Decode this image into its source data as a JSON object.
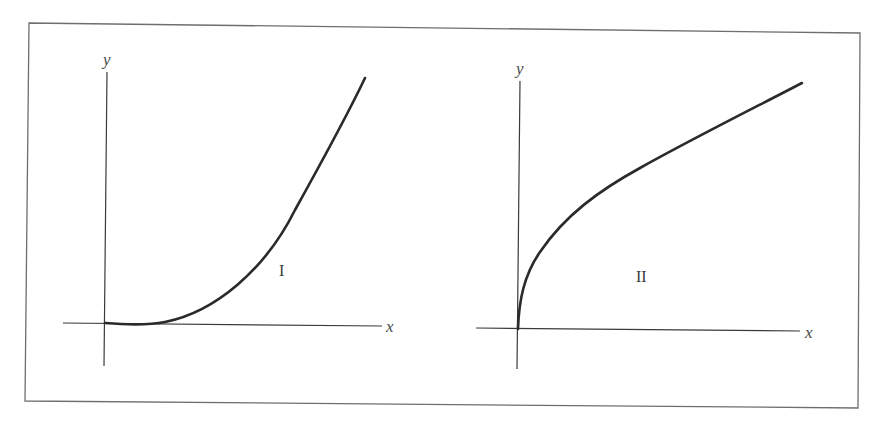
{
  "figure": {
    "graphs": [
      {
        "id": "I",
        "label": "I",
        "x_axis_label": "x",
        "y_axis_label": "y",
        "curve_shape": "concave-up, starts flat at origin and increases (like y = x^2 or x^3)"
      },
      {
        "id": "II",
        "label": "II",
        "x_axis_label": "x",
        "y_axis_label": "y",
        "curve_shape": "concave-down, vertical tangent at origin and increases (like y = sqrt(x))"
      }
    ],
    "colors": {
      "background": "#ffffff",
      "frame": "#6e6e6e",
      "axis": "#3a3a3a",
      "curve": "#2a2a2a"
    }
  }
}
